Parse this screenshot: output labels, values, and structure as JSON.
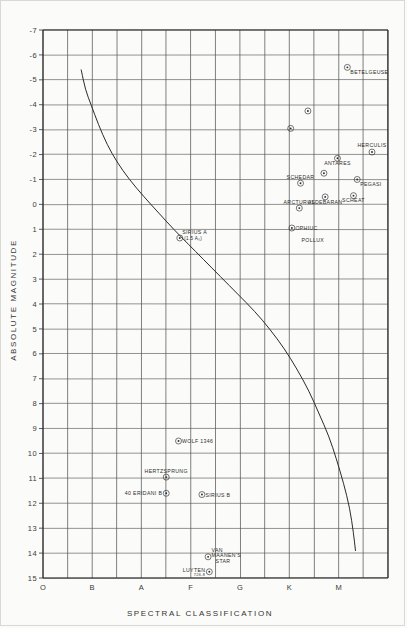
{
  "figure": {
    "background_color": "#fbfbf9",
    "ink_color": "#2e2e2e"
  },
  "axes": {
    "x_title": "SPECTRAL CLASSIFICATION",
    "y_title": "ABSOLUTE MAGNITUDE"
  },
  "chart_data": {
    "type": "scatter",
    "xlabel": "SPECTRAL CLASSIFICATION",
    "ylabel": "ABSOLUTE MAGNITUDE",
    "grid": true,
    "legend": "none",
    "x_tick_labels": [
      "O",
      "B",
      "A",
      "F",
      "G",
      "K",
      "M"
    ],
    "x_tick_positions": [
      0,
      2,
      4,
      6,
      8,
      10,
      12
    ],
    "x_minor_divisions": 14,
    "xlim": [
      0,
      14
    ],
    "y_tick_labels": [
      "-7",
      "-6",
      "-5",
      "-4",
      "-3",
      "-2",
      "-1",
      "0",
      "1",
      "2",
      "3",
      "4",
      "5",
      "6",
      "7",
      "8",
      "9",
      "10",
      "11",
      "12",
      "13",
      "14",
      "15"
    ],
    "y_values": [
      -7,
      -6,
      -5,
      -4,
      -3,
      -2,
      -1,
      0,
      1,
      2,
      3,
      4,
      5,
      6,
      7,
      8,
      9,
      10,
      11,
      12,
      13,
      14,
      15
    ],
    "ylim": [
      -7,
      15
    ],
    "y_inverted": true,
    "main_sequence_curve": {
      "label": "main sequence",
      "points": [
        [
          1.55,
          -5.4
        ],
        [
          1.72,
          -4.6
        ],
        [
          1.95,
          -4.0
        ],
        [
          2.25,
          -3.2
        ],
        [
          2.6,
          -2.4
        ],
        [
          3.0,
          -1.7
        ],
        [
          3.5,
          -1.0
        ],
        [
          4.1,
          -0.3
        ],
        [
          4.7,
          0.35
        ],
        [
          5.3,
          1.0
        ],
        [
          5.9,
          1.6
        ],
        [
          6.5,
          2.2
        ],
        [
          7.2,
          2.9
        ],
        [
          7.9,
          3.6
        ],
        [
          8.6,
          4.3
        ],
        [
          9.2,
          5.0
        ],
        [
          9.8,
          5.8
        ],
        [
          10.3,
          6.6
        ],
        [
          10.8,
          7.5
        ],
        [
          11.2,
          8.4
        ],
        [
          11.6,
          9.3
        ],
        [
          11.9,
          10.2
        ],
        [
          12.2,
          11.2
        ],
        [
          12.45,
          12.2
        ],
        [
          12.6,
          13.2
        ],
        [
          12.68,
          13.9
        ]
      ]
    },
    "series": [
      {
        "name": "labeled stars",
        "points": [
          {
            "label": "BETELGEUSE",
            "x": 12.35,
            "y": -5.5,
            "label_dx": 3,
            "label_dy": 7,
            "label_anchor": "start"
          },
          {
            "label": "",
            "x": 10.75,
            "y": -3.75,
            "label_dx": 0,
            "label_dy": 0,
            "label_anchor": "middle"
          },
          {
            "label": "",
            "x": 10.05,
            "y": -3.05,
            "label_dx": 0,
            "label_dy": 0,
            "label_anchor": "middle"
          },
          {
            "label": "HERCULIS",
            "x": 13.35,
            "y": -2.1,
            "label_dx": 0,
            "label_dy": -5,
            "label_anchor": "middle"
          },
          {
            "label": "ANTARES",
            "x": 11.95,
            "y": -1.85,
            "label_dx": 0,
            "label_dy": 6.5,
            "label_anchor": "middle"
          },
          {
            "label": "PEGASI",
            "x": 12.75,
            "y": -1.0,
            "label_dx": 3,
            "label_dy": 6.5,
            "label_anchor": "start"
          },
          {
            "label": "SCHEDAR",
            "x": 10.45,
            "y": -0.85,
            "label_dx": 0,
            "label_dy": -4.5,
            "label_anchor": "middle"
          },
          {
            "label": "",
            "x": 11.4,
            "y": -1.25,
            "label_dx": 0,
            "label_dy": 0,
            "label_anchor": "middle"
          },
          {
            "label": "SCHEAT",
            "x": 12.6,
            "y": -0.35,
            "label_dx": 0,
            "label_dy": 6.5,
            "label_anchor": "middle"
          },
          {
            "label": "ALDEBARAN",
            "x": 11.45,
            "y": -0.3,
            "label_dx": 0,
            "label_dy": 7,
            "label_anchor": "middle"
          },
          {
            "label": "ARCTURUS",
            "x": 10.4,
            "y": 0.15,
            "label_dx": 0,
            "label_dy": -4.5,
            "label_anchor": "middle"
          },
          {
            "label": "OPHIUC",
            "x": 10.1,
            "y": 0.95,
            "label_dx": 3.5,
            "label_dy": 2,
            "label_anchor": "start"
          },
          {
            "label": "POLLUX",
            "x": 10.95,
            "y": 1.5,
            "label_dx": 0,
            "label_dy": 0,
            "label_anchor": "middle",
            "label_only": true
          },
          {
            "label": "SIRIUS A",
            "x": 5.55,
            "y": 1.35,
            "label_dx": 2.5,
            "label_dy": -3.5,
            "label_anchor": "start",
            "sub_label": "(1.5 A₀)"
          },
          {
            "label": "WOLF 1346",
            "x": 5.5,
            "y": 9.5,
            "label_dx": 3.5,
            "label_dy": 2,
            "label_anchor": "start"
          },
          {
            "label": "HERTZSPRUNG",
            "x": 5.0,
            "y": 10.95,
            "label_dx": 0,
            "label_dy": -4.5,
            "label_anchor": "middle"
          },
          {
            "label": "40 ERIDANI B",
            "x": 5.0,
            "y": 11.6,
            "label_dx": -4,
            "label_dy": 2,
            "label_anchor": "end"
          },
          {
            "label": "SIRIUS B",
            "x": 6.45,
            "y": 11.65,
            "label_dx": 3.5,
            "label_dy": 2,
            "label_anchor": "start"
          },
          {
            "label": "VAN MAANEN'S STAR",
            "x": 6.7,
            "y": 14.15,
            "label_dx": 3.5,
            "label_dy": 0,
            "label_anchor": "start"
          },
          {
            "label": "LUYTEN 726-8",
            "x": 6.75,
            "y": 14.75,
            "label_dx": -4,
            "label_dy": 2,
            "label_anchor": "end"
          }
        ]
      }
    ]
  }
}
